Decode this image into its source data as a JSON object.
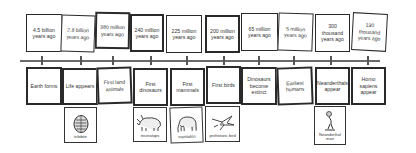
{
  "timeline": {
    "events": [
      {
        "time": "4.5 billion years ago",
        "event": "Earth forms"
      },
      {
        "time": "2.8 billion years ago",
        "event": "Life appears",
        "image_label": "trilobite",
        "icon": "trilobite-icon"
      },
      {
        "time": "380 million years ago",
        "event": "First land animals"
      },
      {
        "time": "240 million years ago",
        "event": "First dinosaurs",
        "image_label": "triceratops",
        "icon": "triceratops-icon"
      },
      {
        "time": "225 million years ago",
        "event": "First mammals",
        "image_label": "mastodon",
        "icon": "mastodon-icon"
      },
      {
        "time": "200 million years ago",
        "event": "First birds",
        "image_label": "prehistoric bird",
        "icon": "prehistoric-bird-icon"
      },
      {
        "time": "65 million years ago",
        "event": "Dinosaurs become extinct"
      },
      {
        "time": "5 million years ago",
        "event": "Earliest humans"
      },
      {
        "time": "300 thousand years ago",
        "event": "Neanderthals appear",
        "image_label": "Neanderthal man",
        "icon": "neanderthal-icon"
      },
      {
        "time": "130 thousand years ago",
        "event": "Homo sapiens appear"
      }
    ]
  },
  "colors": {
    "line": "#6a6a6a",
    "border": "#2a2a2a",
    "background": "#ffffff"
  }
}
